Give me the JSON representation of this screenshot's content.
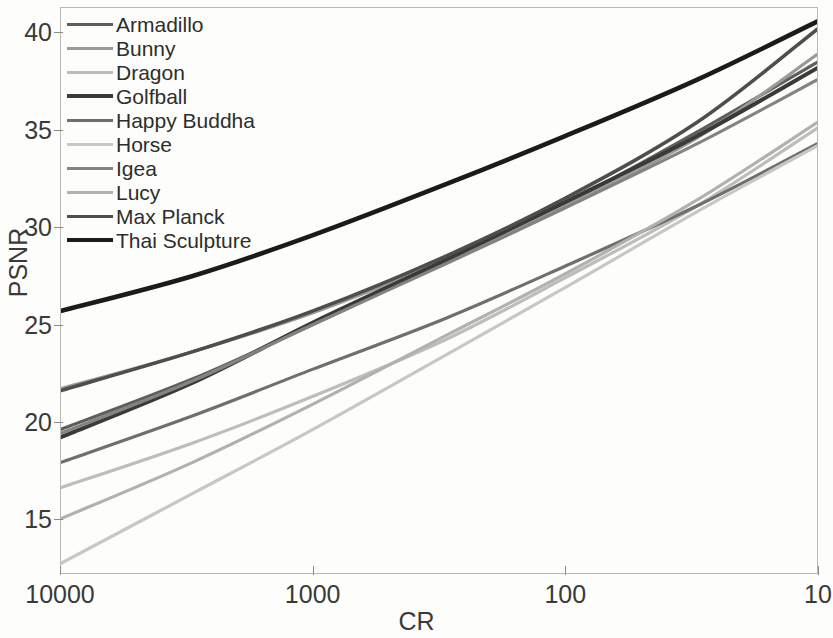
{
  "chart_data": {
    "type": "line",
    "title": "",
    "xlabel": "CR",
    "ylabel": "PSNR",
    "xscale": "log",
    "x_reversed": true,
    "xlim": [
      10000,
      10
    ],
    "ylim": [
      12.2,
      41.3
    ],
    "xticks": [
      "10000",
      "1000",
      "100",
      "10"
    ],
    "xtick_values": [
      10000,
      1000,
      100,
      10
    ],
    "yticks": [
      "40",
      "35",
      "30",
      "25",
      "20",
      "15"
    ],
    "ytick_values": [
      40,
      35,
      30,
      25,
      20,
      15
    ],
    "grid": false,
    "legend_position": "top-left",
    "x": [
      10000,
      3000,
      1000,
      300,
      100,
      30,
      10
    ],
    "series": [
      {
        "name": "Armadillo",
        "color": "#5e5e5c",
        "width": 3.2,
        "values": [
          19.6,
          22.2,
          25.0,
          28.2,
          31.2,
          34.9,
          38.5
        ]
      },
      {
        "name": "Bunny",
        "color": "#9a9a96",
        "width": 3.2,
        "values": [
          21.7,
          23.6,
          25.6,
          28.3,
          31.1,
          34.6,
          38.9
        ]
      },
      {
        "name": "Dragon",
        "color": "#bdbdb9",
        "width": 3.2,
        "values": [
          16.6,
          18.9,
          21.3,
          24.2,
          27.4,
          31.1,
          35.1
        ]
      },
      {
        "name": "Golfball",
        "color": "#3a3a38",
        "width": 4.0,
        "values": [
          19.2,
          22.0,
          25.1,
          28.3,
          31.3,
          34.7,
          38.2
        ]
      },
      {
        "name": "Happy Buddha",
        "color": "#6f6f6c",
        "width": 3.2,
        "values": [
          17.9,
          20.3,
          22.7,
          25.3,
          28.0,
          31.1,
          34.3
        ]
      },
      {
        "name": "Horse",
        "color": "#c7c7c3",
        "width": 3.2,
        "values": [
          12.7,
          16.3,
          19.6,
          23.4,
          26.9,
          30.8,
          34.2
        ]
      },
      {
        "name": "Igea",
        "color": "#84847f",
        "width": 3.2,
        "values": [
          19.4,
          22.1,
          25.0,
          28.1,
          31.0,
          34.3,
          37.6
        ]
      },
      {
        "name": "Lucy",
        "color": "#b2b2ad",
        "width": 3.2,
        "values": [
          15.0,
          17.9,
          20.9,
          24.4,
          27.6,
          31.4,
          35.4
        ]
      },
      {
        "name": "Max Planck",
        "color": "#4e4e4b",
        "width": 3.6,
        "values": [
          21.6,
          23.6,
          25.7,
          28.5,
          31.5,
          35.4,
          40.2
        ]
      },
      {
        "name": "Thai Sculpture",
        "color": "#1b1b1a",
        "width": 4.6,
        "values": [
          25.7,
          27.5,
          29.6,
          32.2,
          34.7,
          37.6,
          40.6
        ]
      }
    ]
  }
}
